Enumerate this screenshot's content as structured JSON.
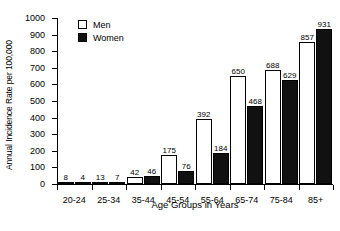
{
  "chart_data": {
    "type": "bar",
    "title": "",
    "xlabel": "Age Groups in Years",
    "ylabel": "Annual Incidence Rate per 100,000",
    "categories": [
      "20-24",
      "25-34",
      "35-44",
      "45-54",
      "55-64",
      "65-74",
      "75-84",
      "85+"
    ],
    "series": [
      {
        "name": "Men",
        "color": "#ffffff",
        "values": [
          8,
          13,
          42,
          175,
          392,
          650,
          688,
          857
        ]
      },
      {
        "name": "Women",
        "color": "#111111",
        "values": [
          4,
          7,
          46,
          76,
          184,
          468,
          629,
          931
        ]
      }
    ],
    "ylim": [
      0,
      1000
    ],
    "yticks": [
      0,
      100,
      200,
      300,
      400,
      500,
      600,
      700,
      800,
      900,
      1000
    ],
    "ytick_labels": [
      "0",
      "100",
      "200",
      "300",
      "400",
      "500",
      "600",
      "700",
      "800",
      "900",
      "1000"
    ],
    "grid": false,
    "legend_position": "top-left-inside",
    "legend": [
      "Men",
      "Women"
    ],
    "data_labels": true
  }
}
